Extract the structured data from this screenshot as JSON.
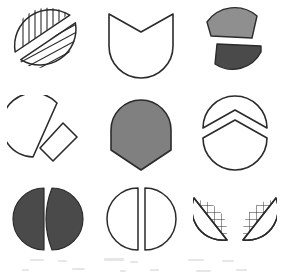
{
  "figure": {
    "rows": 3,
    "columns": 3,
    "background_color": "#ffffff",
    "stroke_color": "#2b2b2b"
  },
  "palette": {
    "outline": "#2b2b2b",
    "white_fill": "#ffffff",
    "light_gray_fill": "#8f8f8f",
    "medium_gray_fill": "#808080",
    "dark_gray_fill": "#4a4a4a",
    "hatch_line": "#2b2b2b"
  },
  "items": [
    {
      "index": 1,
      "position": "row 1, column 1",
      "name": "hatched-split-circle",
      "label": "Circle split along a diagonal into two line-hatched halves",
      "fill": "#ffffff",
      "pattern": "diagonal-hatch",
      "pieces": 2,
      "separated": true
    },
    {
      "index": 2,
      "position": "row 1, column 2",
      "name": "v-notch-circle",
      "label": "Circle with a V notch cut into the top edge",
      "fill": "#ffffff",
      "pattern": "none",
      "pieces": 1,
      "separated": false
    },
    {
      "index": 3,
      "position": "row 1, column 3",
      "name": "two-gray-segments",
      "label": "Two shaded circular segments pulled apart, light gray above dark gray",
      "fill": "#8f8f8f",
      "pattern": "solid",
      "pieces": 2,
      "separated": true
    },
    {
      "index": 4,
      "position": "row 2, column 1",
      "name": "sector-and-slab",
      "label": "Circle sector with a detached rectangular slab slid to the lower right",
      "fill": "#ffffff",
      "pattern": "none",
      "pieces": 2,
      "separated": true
    },
    {
      "index": 5,
      "position": "row 2, column 2",
      "name": "gray-dome-point",
      "label": "Solid gray shape with a domed top and a pointed chevron base",
      "fill": "#808080",
      "pattern": "solid",
      "pieces": 1,
      "separated": false
    },
    {
      "index": 6,
      "position": "row 2, column 3",
      "name": "chevron-split-circle",
      "label": "Circle cut by a chevron line into a notched dome and a peaked base",
      "fill": "#ffffff",
      "pattern": "none",
      "pieces": 2,
      "separated": true
    },
    {
      "index": 7,
      "position": "row 3, column 1",
      "name": "dark-split-circle",
      "label": "Dark gray circle split vertically into two halves with a gap",
      "fill": "#4a4a4a",
      "pattern": "solid",
      "pieces": 2,
      "separated": true
    },
    {
      "index": 8,
      "position": "row 3, column 2",
      "name": "white-split-circle",
      "label": "White outlined circle split vertically into two halves with a gap",
      "fill": "#ffffff",
      "pattern": "none",
      "pieces": 2,
      "separated": true
    },
    {
      "index": 9,
      "position": "row 3, column 3",
      "name": "crosshatched-wings",
      "label": "Two mirrored cross-hatched half segments tilted apart like wings",
      "fill": "#ffffff",
      "pattern": "cross-hatch",
      "pieces": 2,
      "separated": true
    }
  ]
}
